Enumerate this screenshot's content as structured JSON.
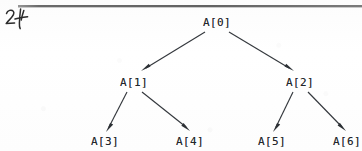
{
  "page": {
    "kind": "scanned-textbook-figure",
    "width": 362,
    "height": 151,
    "background_color": "#fdfdfd",
    "ink_color": "#23262b"
  },
  "annotations": {
    "handwritten_margin_note": "24"
  },
  "rule": {
    "name": "top-horizontal-rule",
    "color": "#545454"
  },
  "diagram": {
    "type": "binary-tree",
    "nodes": [
      {
        "id": "n0",
        "label": "A[0]",
        "x": 217,
        "y": 22,
        "level": 0
      },
      {
        "id": "n1",
        "label": "A[1]",
        "x": 134,
        "y": 82,
        "level": 1
      },
      {
        "id": "n2",
        "label": "A[2]",
        "x": 300,
        "y": 82,
        "level": 1
      },
      {
        "id": "n3",
        "label": "A[3]",
        "x": 105,
        "y": 141,
        "level": 2
      },
      {
        "id": "n4",
        "label": "A[4]",
        "x": 190,
        "y": 141,
        "level": 2
      },
      {
        "id": "n5",
        "label": "A[5]",
        "x": 272,
        "y": 141,
        "level": 2
      },
      {
        "id": "n6",
        "label": "A[6]",
        "x": 347,
        "y": 141,
        "level": 2
      }
    ],
    "edges": [
      {
        "id": "e0",
        "from": "A[0]",
        "to": "A[1]",
        "directed": true
      },
      {
        "id": "e1",
        "from": "A[0]",
        "to": "A[2]",
        "directed": true
      },
      {
        "id": "e2",
        "from": "A[1]",
        "to": "A[3]",
        "directed": true
      },
      {
        "id": "e3",
        "from": "A[1]",
        "to": "A[4]",
        "directed": true
      },
      {
        "id": "e4",
        "from": "A[2]",
        "to": "A[5]",
        "directed": true
      },
      {
        "id": "e5",
        "from": "A[2]",
        "to": "A[6]",
        "directed": true
      }
    ],
    "edge_color": "#34383d"
  }
}
